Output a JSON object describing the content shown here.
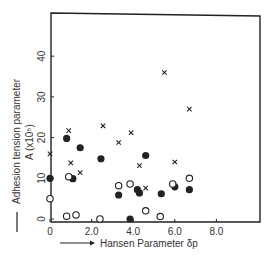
{
  "chart_data": {
    "type": "scatter",
    "title": "",
    "xlabel": "Hansen Parameter  δp",
    "ylabel_line1": "Adhesion tension parameter",
    "ylabel_line2": "A (x10⁵)",
    "xlim": [
      0,
      10
    ],
    "ylim": [
      0,
      50
    ],
    "xticks": [
      {
        "value": 0,
        "label": "0"
      },
      {
        "value": 2,
        "label": "2.0"
      },
      {
        "value": 4,
        "label": "4.0"
      },
      {
        "value": 6,
        "label": "6.0"
      },
      {
        "value": 8,
        "label": "8.0"
      }
    ],
    "yticks": [
      {
        "value": 0,
        "label": "0"
      },
      {
        "value": 10,
        "label": "10"
      },
      {
        "value": 20,
        "label": "20"
      },
      {
        "value": 30,
        "label": "30"
      },
      {
        "value": 40,
        "label": "40"
      }
    ],
    "grid": false,
    "legend": null,
    "series": [
      {
        "name": "filled-circle",
        "marker": "filled-circle",
        "points": [
          [
            0.0,
            10.0
          ],
          [
            0.8,
            19.8
          ],
          [
            1.45,
            17.5
          ],
          [
            1.1,
            9.9
          ],
          [
            2.45,
            14.8
          ],
          [
            4.6,
            15.6
          ],
          [
            3.3,
            5.9
          ],
          [
            4.2,
            7.2
          ],
          [
            4.3,
            6.4
          ],
          [
            5.35,
            6.2
          ],
          [
            6.0,
            7.9
          ],
          [
            6.7,
            7.2
          ],
          [
            3.85,
            0.0
          ]
        ]
      },
      {
        "name": "open-circle",
        "marker": "open-circle",
        "points": [
          [
            0.0,
            5.0
          ],
          [
            0.9,
            10.4
          ],
          [
            0.8,
            0.7
          ],
          [
            1.25,
            1.0
          ],
          [
            2.4,
            0.0
          ],
          [
            3.3,
            8.2
          ],
          [
            3.85,
            8.6
          ],
          [
            5.9,
            8.6
          ],
          [
            6.7,
            10.0
          ],
          [
            4.6,
            2.0
          ],
          [
            5.3,
            0.6
          ]
        ]
      },
      {
        "name": "cross",
        "marker": "cross",
        "points": [
          [
            0.0,
            16.0
          ],
          [
            0.9,
            21.7
          ],
          [
            1.0,
            13.8
          ],
          [
            1.45,
            11.4
          ],
          [
            2.55,
            22.9
          ],
          [
            3.3,
            18.8
          ],
          [
            3.9,
            21.2
          ],
          [
            4.3,
            13.1
          ],
          [
            4.6,
            7.6
          ],
          [
            5.5,
            36.0
          ],
          [
            6.0,
            14.0
          ],
          [
            6.7,
            27.0
          ]
        ]
      }
    ]
  },
  "colors": {
    "ink": "#222222",
    "background": "#ffffff"
  }
}
